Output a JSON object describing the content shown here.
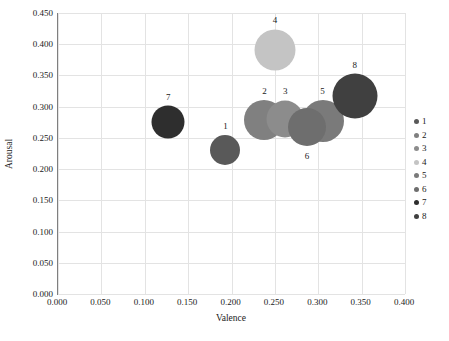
{
  "chart_data": {
    "type": "scatter",
    "title": "",
    "xlabel": "Valence",
    "ylabel": "Arousal",
    "xlim": [
      0.0,
      0.4
    ],
    "ylim": [
      0.0,
      0.45
    ],
    "xticks": [
      "0.000",
      "0.050",
      "0.100",
      "0.150",
      "0.200",
      "0.250",
      "0.300",
      "0.350",
      "0.400"
    ],
    "yticks": [
      "0.000",
      "0.050",
      "0.100",
      "0.150",
      "0.200",
      "0.250",
      "0.300",
      "0.350",
      "0.400",
      "0.450"
    ],
    "xtick_values": [
      0.0,
      0.05,
      0.1,
      0.15,
      0.2,
      0.25,
      0.3,
      0.35,
      0.4
    ],
    "ytick_values": [
      0.0,
      0.05,
      0.1,
      0.15,
      0.2,
      0.25,
      0.3,
      0.35,
      0.4,
      0.45
    ],
    "grid": true,
    "legend_position": "right",
    "points": [
      {
        "label": "1",
        "x": 0.193,
        "y": 0.231,
        "size": 30,
        "color": "#595959",
        "label_dx": 0,
        "label_dy": -24
      },
      {
        "label": "2",
        "x": 0.238,
        "y": 0.278,
        "size": 40,
        "color": "#808080",
        "label_dx": 0,
        "label_dy": -29
      },
      {
        "label": "3",
        "x": 0.262,
        "y": 0.28,
        "size": 37,
        "color": "#8c8c8c",
        "label_dx": 0,
        "label_dy": -28
      },
      {
        "label": "4",
        "x": 0.25,
        "y": 0.39,
        "size": 41,
        "color": "#c4c4c4",
        "label_dx": 0,
        "label_dy": -30
      },
      {
        "label": "5",
        "x": 0.305,
        "y": 0.277,
        "size": 42,
        "color": "#7a7a7a",
        "label_dx": 0,
        "label_dy": -30
      },
      {
        "label": "6",
        "x": 0.287,
        "y": 0.267,
        "size": 38,
        "color": "#6e6e6e",
        "label_dx": 0,
        "label_dy": 29
      },
      {
        "label": "7",
        "x": 0.127,
        "y": 0.276,
        "size": 33,
        "color": "#2e2e2e",
        "label_dx": 0,
        "label_dy": -25
      },
      {
        "label": "8",
        "x": 0.342,
        "y": 0.317,
        "size": 45,
        "color": "#404040",
        "label_dx": 0,
        "label_dy": -31
      }
    ],
    "legend": [
      {
        "label": "1",
        "color": "#595959"
      },
      {
        "label": "2",
        "color": "#808080"
      },
      {
        "label": "3",
        "color": "#8c8c8c"
      },
      {
        "label": "4",
        "color": "#c4c4c4"
      },
      {
        "label": "5",
        "color": "#7a7a7a"
      },
      {
        "label": "6",
        "color": "#6e6e6e"
      },
      {
        "label": "7",
        "color": "#2e2e2e"
      },
      {
        "label": "8",
        "color": "#404040"
      }
    ]
  }
}
